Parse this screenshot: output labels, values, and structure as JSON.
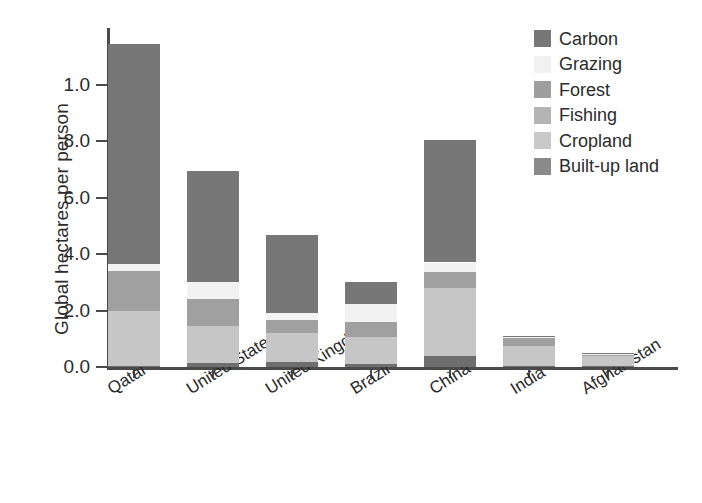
{
  "chart_data": {
    "type": "bar",
    "stacked": true,
    "title": "",
    "xlabel": "",
    "ylabel": "Global hectares per person",
    "ylim": [
      0,
      12
    ],
    "grid": false,
    "legend_position": "top-right",
    "categories": [
      "Qatar",
      "United States",
      "United Kingdom",
      "Brazil",
      "China",
      "India",
      "Afghanistan"
    ],
    "y_ticks": [
      {
        "value": 0.0,
        "label": "0.0"
      },
      {
        "value": 2.0,
        "label": "2.0"
      },
      {
        "value": 4.0,
        "label": "4.0"
      },
      {
        "value": 6.0,
        "label": "6.0"
      },
      {
        "value": 8.0,
        "label": "8.0"
      },
      {
        "value": 10.0,
        "label": "1.0"
      }
    ],
    "series": [
      {
        "name": "Built-up land",
        "color": "#6e6e6e",
        "values": [
          0.05,
          0.15,
          0.18,
          0.1,
          0.4,
          0.05,
          0.03
        ]
      },
      {
        "name": "Cropland",
        "color": "#c6c6c6",
        "values": [
          1.95,
          1.3,
          1.02,
          0.95,
          2.4,
          0.7,
          0.37
        ]
      },
      {
        "name": "Fishing",
        "color": "#b0b0b0",
        "values": [
          0.0,
          0.0,
          0.0,
          0.0,
          0.0,
          0.0,
          0.0
        ]
      },
      {
        "name": "Forest",
        "color": "#a0a0a0",
        "values": [
          1.4,
          0.95,
          0.45,
          0.55,
          0.55,
          0.3,
          0.02
        ]
      },
      {
        "name": "Grazing",
        "color": "#f2f2f2",
        "values": [
          0.25,
          0.6,
          0.27,
          0.62,
          0.35,
          0.02,
          0.06
        ]
      },
      {
        "name": "Carbon",
        "color": "#777777",
        "values": [
          7.8,
          3.95,
          2.75,
          0.78,
          4.35,
          0.03,
          0.02
        ]
      }
    ],
    "totals": [
      11.45,
      6.95,
      4.67,
      3.0,
      8.05,
      1.1,
      0.5
    ],
    "annotations": []
  },
  "legend": {
    "items": [
      {
        "label": "Carbon",
        "color": "#777777"
      },
      {
        "label": "Grazing",
        "color": "#f1f1f1"
      },
      {
        "label": "Forest",
        "color": "#9e9e9e"
      },
      {
        "label": "Fishing",
        "color": "#b4b4b4"
      },
      {
        "label": "Cropland",
        "color": "#c9c9c9"
      },
      {
        "label": "Built-up land",
        "color": "#8a8a8a"
      }
    ]
  },
  "axes": {
    "y_title": "Global hectares per person"
  }
}
